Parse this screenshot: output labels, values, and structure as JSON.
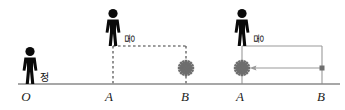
{
  "figure": {
    "background_color": "#ffffff",
    "axis": {
      "color": "#8a8a8a",
      "baseline_y": 84,
      "x_start": 18,
      "x_end": 340,
      "tick_labels": [
        {
          "text": "O",
          "x": 26,
          "y": 101
        },
        {
          "text": "A",
          "x": 107,
          "y": 101
        },
        {
          "text": "B",
          "x": 182,
          "y": 101
        },
        {
          "text": "A",
          "x": 238,
          "y": 101
        },
        {
          "text": "B",
          "x": 318,
          "y": 101
        }
      ]
    },
    "people": [
      {
        "id": "person-rest",
        "label": "정",
        "label_rotated": false,
        "x": 30,
        "stand_y": 84,
        "color": "#0a0a0a",
        "label_x": 40,
        "label_y": 81
      },
      {
        "id": "person-moving-dashed",
        "label": "움",
        "label_rotated": true,
        "x": 113,
        "stand_y": 46,
        "color": "#0a0a0a",
        "label_x": 123,
        "label_y": 40
      },
      {
        "id": "person-moving-solid",
        "label": "움",
        "label_rotated": true,
        "x": 242,
        "stand_y": 46,
        "color": "#0a0a0a",
        "label_x": 252,
        "label_y": 40
      }
    ],
    "dashed_path": {
      "style": "dashed",
      "color": "#3c3c3c",
      "top_y": 46,
      "left_x": 113,
      "right_x": 186,
      "bottom_y": 84
    },
    "solid_path": {
      "style": "solid",
      "color": "#9a9a9a",
      "top_y": 46,
      "left_x": 242,
      "right_x": 322,
      "bottom_y": 84
    },
    "light_sources": [
      {
        "id": "burst-dashed",
        "x": 186,
        "y": 68,
        "color": "#6e6e6e",
        "radius": 7
      },
      {
        "id": "burst-solid",
        "x": 242,
        "y": 68,
        "color": "#6e6e6e",
        "radius": 7
      }
    ],
    "endpoint_dot": {
      "id": "endpoint-dot",
      "x": 322,
      "y": 68,
      "color": "#6e6e6e",
      "size": 5
    },
    "arrow": {
      "id": "leftward-arrow",
      "from_x": 322,
      "to_x": 251,
      "y": 68,
      "direction": "left",
      "color": "#9a9a9a"
    }
  }
}
